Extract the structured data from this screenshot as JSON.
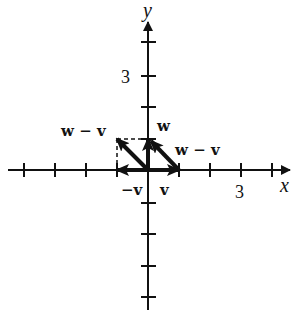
{
  "diagram": {
    "axes": {
      "x_label": "x",
      "y_label": "y",
      "x_tick_label": "3",
      "y_tick_label": "3",
      "x_range": [
        -4,
        4
      ],
      "y_range": [
        -4,
        4
      ]
    },
    "vectors": [
      {
        "name": "v",
        "label": "v",
        "from": [
          0,
          0
        ],
        "to": [
          1,
          0
        ]
      },
      {
        "name": "-v",
        "label": "−v",
        "from": [
          0,
          0
        ],
        "to": [
          -1,
          0
        ]
      },
      {
        "name": "w",
        "label": "w",
        "from": [
          0,
          0
        ],
        "to": [
          0,
          1
        ]
      },
      {
        "name": "w-v-left",
        "label": "w − v",
        "from": [
          0,
          0
        ],
        "to": [
          -1,
          1
        ]
      },
      {
        "name": "w-v-right",
        "label": "w − v",
        "from": [
          1,
          0
        ],
        "to": [
          0,
          1
        ]
      }
    ],
    "labels": {
      "v": "v",
      "neg_v": "−v",
      "w": "w",
      "w_minus_v_left": "w − v",
      "w_minus_v_right": "w − v"
    },
    "colors": {
      "ink": "#111111",
      "background": "#ffffff"
    }
  }
}
